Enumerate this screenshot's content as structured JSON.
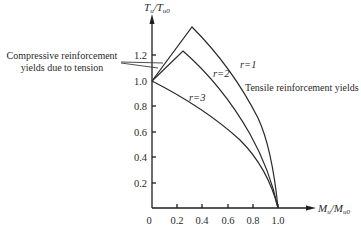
{
  "figure": {
    "y_axis_label_main": "T",
    "y_axis_label_sub": "u",
    "y_axis_label_den": "/T",
    "y_axis_label_den_sub": "u0",
    "x_axis_label_main": "M",
    "x_axis_label_sub": "u",
    "x_axis_label_den": "/M",
    "x_axis_label_den_sub": "u0",
    "x_ticks": [
      "0",
      "0.2",
      "0.4",
      "0.6",
      "0.8",
      "1.0"
    ],
    "y_ticks": [
      "0.2",
      "0.4",
      "0.6",
      "0.8",
      "1.0",
      "1.2"
    ],
    "annotations": {
      "compressive_line1": "Compressive reinforcement",
      "compressive_line2": "yields due to tension",
      "tensile": "Tensile reinforcement yields",
      "r1": "r=1",
      "r2": "r=2",
      "r3": "r=3"
    }
  },
  "diagram_data": {
    "type": "interaction-curves",
    "xlabel": "Mu/Mu0",
    "ylabel": "Tu/Tu0",
    "xlim": [
      0,
      1.1
    ],
    "ylim": [
      0,
      1.5
    ],
    "curves": [
      {
        "name": "r=1",
        "peak": [
          0.32,
          1.42
        ],
        "points": [
          [
            0,
            1.0
          ],
          [
            0.32,
            1.42
          ],
          [
            0.6,
            1.08
          ],
          [
            0.8,
            0.7
          ],
          [
            0.95,
            0.3
          ],
          [
            1.0,
            0.0
          ]
        ]
      },
      {
        "name": "r=2",
        "peak": [
          0.25,
          1.23
        ],
        "points": [
          [
            0,
            1.0
          ],
          [
            0.25,
            1.23
          ],
          [
            0.5,
            0.95
          ],
          [
            0.75,
            0.6
          ],
          [
            0.93,
            0.25
          ],
          [
            1.0,
            0.0
          ]
        ]
      },
      {
        "name": "r=3",
        "points": [
          [
            0,
            1.0
          ],
          [
            0.3,
            0.78
          ],
          [
            0.6,
            0.5
          ],
          [
            0.85,
            0.25
          ],
          [
            1.0,
            0.0
          ]
        ]
      }
    ]
  }
}
